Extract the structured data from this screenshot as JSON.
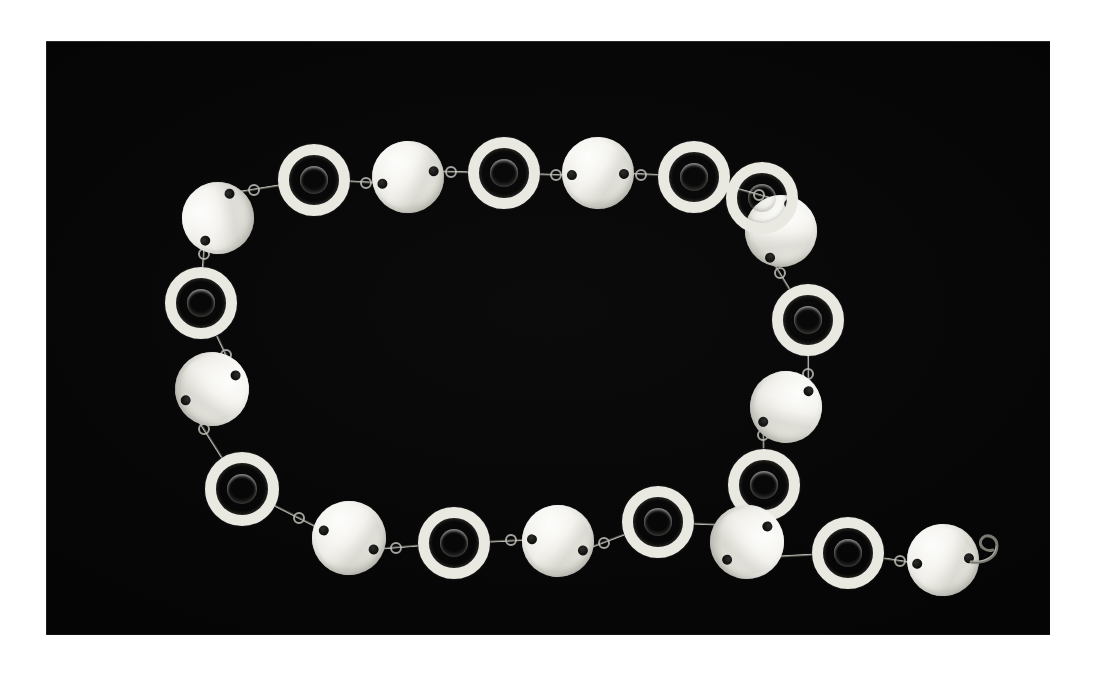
{
  "document": {
    "title": "Necklace photograph",
    "background_color": "#ffffff",
    "subject": "shell-disc and ring necklace chain"
  },
  "photo": {
    "name": "necklace-photo",
    "background_color": "#050505",
    "frame": {
      "x": 46,
      "y": 41,
      "width": 1004,
      "height": 594
    },
    "alt_text": "A necklace of white mother-of-pearl discs alternating with white rings, arranged in a loop on a black background"
  },
  "palette": {
    "plate_black": "#050505",
    "disc_white": "#f2f1ec",
    "disc_highlight": "#fdfdfb",
    "disc_shadow": "#b8b7ae",
    "ring_white": "#e9e8e1",
    "wire_metal": "#787770",
    "hole_black": "#0b0b0a",
    "page_white": "#ffffff"
  },
  "necklace": {
    "name": "shell-disc-necklace",
    "total_pieces": 22,
    "disc_count": 11,
    "ring_count": 11,
    "has_clasp": true,
    "clasp_type": "open wire s-hook",
    "pieces": [
      {
        "id": "disc-1",
        "type": "disc",
        "cx": 172,
        "cy": 177,
        "r": 36,
        "rot": -38,
        "holes": [
          [
            -24,
            10
          ],
          [
            24,
            -12
          ]
        ]
      },
      {
        "id": "ring-1",
        "type": "ring",
        "cx": 268,
        "cy": 139,
        "r": 36,
        "thickness": 11,
        "rot": 0
      },
      {
        "id": "disc-2",
        "type": "disc",
        "cx": 362,
        "cy": 136,
        "r": 36,
        "rot": -4,
        "holes": [
          [
            -26,
            5
          ],
          [
            26,
            -4
          ]
        ]
      },
      {
        "id": "ring-2",
        "type": "ring",
        "cx": 458,
        "cy": 132,
        "r": 36,
        "thickness": 11,
        "rot": 0
      },
      {
        "id": "disc-3",
        "type": "disc",
        "cx": 552,
        "cy": 132,
        "r": 36,
        "rot": 2,
        "holes": [
          [
            -26,
            3
          ],
          [
            26,
            0
          ]
        ]
      },
      {
        "id": "ring-3",
        "type": "ring",
        "cx": 648,
        "cy": 136,
        "r": 36,
        "thickness": 11,
        "rot": 0
      },
      {
        "id": "disc-4",
        "type": "disc",
        "cx": 735,
        "cy": 190,
        "r": 36,
        "rot": 56,
        "holes": [
          [
            -18,
            -22
          ],
          [
            16,
            24
          ]
        ]
      },
      {
        "id": "ring-4",
        "type": "ring",
        "cx": 762,
        "cy": 279,
        "r": 36,
        "thickness": 11,
        "rot": 0
      },
      {
        "id": "disc-5",
        "type": "disc",
        "cx": 740,
        "cy": 366,
        "r": 36,
        "rot": 74,
        "holes": [
          [
            -9,
            -26
          ],
          [
            8,
            26
          ]
        ]
      },
      {
        "id": "ring-5",
        "type": "ring",
        "cx": 718,
        "cy": 444,
        "r": 36,
        "thickness": 11,
        "rot": 0
      },
      {
        "id": "disc-6",
        "type": "disc",
        "cx": 701,
        "cy": 501,
        "r": 37,
        "rot": 104,
        "holes": [
          [
            -20,
            -16
          ],
          [
            22,
            15
          ]
        ]
      },
      {
        "id": "ring-6",
        "type": "ring",
        "cx": 802,
        "cy": 512,
        "r": 36,
        "thickness": 11,
        "rot": 0
      },
      {
        "id": "disc-7",
        "type": "disc",
        "cx": 897,
        "cy": 519,
        "r": 36,
        "rot": -4,
        "holes": [
          [
            -26,
            2
          ],
          [
            26,
            0
          ]
        ]
      },
      {
        "id": "ring-7",
        "type": "ring",
        "cx": 612,
        "cy": 481,
        "r": 36,
        "thickness": 11,
        "rot": 0
      },
      {
        "id": "disc-8",
        "type": "disc",
        "cx": 512,
        "cy": 500,
        "r": 36,
        "rot": 8,
        "holes": [
          [
            -26,
            2
          ],
          [
            26,
            6
          ]
        ]
      },
      {
        "id": "ring-8",
        "type": "ring",
        "cx": 408,
        "cy": 502,
        "r": 36,
        "thickness": 11,
        "rot": 0
      },
      {
        "id": "disc-9",
        "type": "disc",
        "cx": 303,
        "cy": 497,
        "r": 37,
        "rot": 8,
        "holes": [
          [
            -26,
            -4
          ],
          [
            26,
            8
          ]
        ]
      },
      {
        "id": "ring-9",
        "type": "ring",
        "cx": 196,
        "cy": 448,
        "r": 37,
        "thickness": 11,
        "rot": 0
      },
      {
        "id": "disc-10",
        "type": "disc",
        "cx": 166,
        "cy": 348,
        "r": 37,
        "rot": 96,
        "holes": [
          [
            -16,
            -22
          ],
          [
            14,
            25
          ]
        ]
      },
      {
        "id": "ring-10",
        "type": "ring",
        "cx": 155,
        "cy": 262,
        "r": 36,
        "thickness": 11,
        "rot": 0
      },
      {
        "id": "ring-11",
        "type": "ring",
        "cx": 716,
        "cy": 157,
        "r": 36,
        "thickness": 11,
        "rot": 0
      }
    ]
  },
  "image_meta": {
    "width": 1094,
    "height": 679,
    "type": "photograph",
    "orientation": "landscape"
  }
}
